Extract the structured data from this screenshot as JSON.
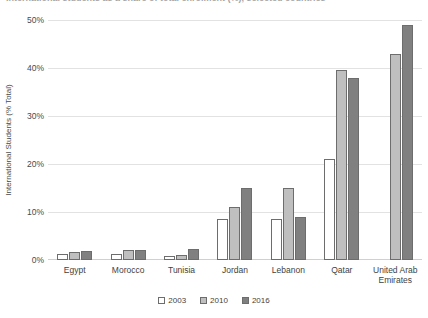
{
  "title_partial": "International students as a share of total enrolment (%), selected countries",
  "legend": {
    "position": "bottom",
    "entries": [
      {
        "label": "2003",
        "color": "#ffffff"
      },
      {
        "label": "2010",
        "color": "#bfbfbf"
      },
      {
        "label": "2016",
        "color": "#808080"
      }
    ]
  },
  "axis": {
    "ylabel": "International Students (% Total)",
    "yticks": [
      "0%",
      "10%",
      "20%",
      "30%",
      "40%",
      "50%"
    ],
    "xlabel": ""
  },
  "chart_data": {
    "type": "bar",
    "title": "International students as a share of total enrolment (%), selected countries",
    "xlabel": "",
    "ylabel": "International Students (% Total)",
    "ylim": [
      0,
      50
    ],
    "ytick_values": [
      0,
      10,
      20,
      30,
      40,
      50
    ],
    "grid": true,
    "legend_position": "bottom",
    "categories": [
      "Egypt",
      "Morocco",
      "Tunisia",
      "Jordan",
      "Lebanon",
      "Qatar",
      "United Arab Emirates"
    ],
    "series": [
      {
        "name": "2003",
        "color": "#ffffff",
        "values": [
          1.2,
          1.3,
          0.8,
          8.5,
          8.5,
          21.0,
          0
        ]
      },
      {
        "name": "2010",
        "color": "#bfbfbf",
        "values": [
          1.6,
          2.0,
          1.0,
          11.0,
          15.0,
          39.5,
          43.0
        ]
      },
      {
        "name": "2016",
        "color": "#808080",
        "values": [
          1.8,
          2.0,
          2.3,
          15.0,
          9.0,
          38.0,
          49.0
        ]
      }
    ]
  }
}
